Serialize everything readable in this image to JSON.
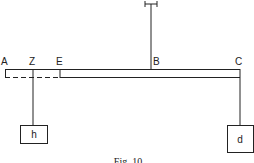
{
  "figure": {
    "caption": "Fig. 10",
    "points": {
      "A": "A",
      "Z": "Z",
      "E": "E",
      "B": "B",
      "C": "C"
    },
    "weights": {
      "h": "h",
      "d": "d"
    }
  }
}
